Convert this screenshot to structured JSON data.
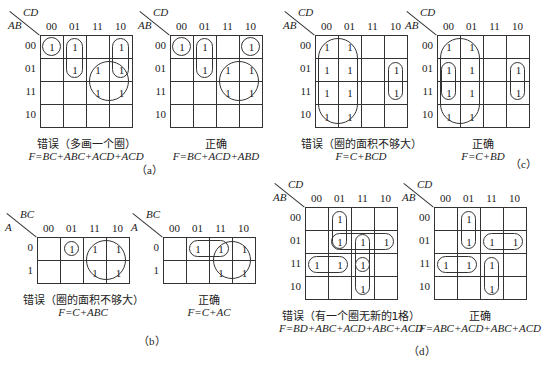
{
  "figures": {
    "a": {
      "label": "（a）",
      "wrong": {
        "row_var": "AB",
        "col_var": "CD",
        "col_labels": [
          "00",
          "01",
          "11",
          "10"
        ],
        "row_labels": [
          "00",
          "01",
          "11",
          "10"
        ],
        "cells": [
          [
            "1",
            "1",
            "",
            "1"
          ],
          [
            "",
            "1",
            "1",
            "1"
          ],
          [
            "",
            "",
            "1",
            "1"
          ],
          [
            "",
            "",
            "",
            ""
          ]
        ],
        "caption": "错误（多画一个圈）",
        "formula": "F=BC+ABC+ACD+ACD"
      },
      "right": {
        "row_var": "AB",
        "col_var": "CD",
        "col_labels": [
          "00",
          "01",
          "11",
          "10"
        ],
        "row_labels": [
          "00",
          "01",
          "11",
          "10"
        ],
        "cells": [
          [
            "1",
            "1",
            "",
            "1"
          ],
          [
            "",
            "1",
            "1",
            "1"
          ],
          [
            "",
            "",
            "1",
            "1"
          ],
          [
            "",
            "",
            "",
            ""
          ]
        ],
        "caption": "正确",
        "formula": "F=BC+ACD+ABD"
      }
    },
    "b": {
      "label": "（b）",
      "wrong": {
        "row_var": "A",
        "col_var": "BC",
        "col_labels": [
          "00",
          "01",
          "11",
          "10"
        ],
        "row_labels": [
          "0",
          "1"
        ],
        "cells": [
          [
            "",
            "1",
            "1",
            "1"
          ],
          [
            "",
            "",
            "1",
            "1"
          ]
        ],
        "caption": "错误（圈的面积不够大）",
        "formula": "F=C+ABC"
      },
      "right": {
        "row_var": "A",
        "col_var": "BC",
        "col_labels": [
          "00",
          "01",
          "11",
          "10"
        ],
        "row_labels": [
          "0",
          "1"
        ],
        "cells": [
          [
            "",
            "1",
            "1",
            "1"
          ],
          [
            "",
            "",
            "1",
            "1"
          ]
        ],
        "caption": "正确",
        "formula": "F=C+AC"
      }
    },
    "c": {
      "label": "（c）",
      "wrong": {
        "row_var": "AB",
        "col_var": "CD",
        "col_labels": [
          "00",
          "01",
          "11",
          "10"
        ],
        "row_labels": [
          "00",
          "01",
          "11",
          "10"
        ],
        "cells": [
          [
            "1",
            "1",
            "",
            ""
          ],
          [
            "1",
            "1",
            "",
            "1"
          ],
          [
            "1",
            "1",
            "",
            "1"
          ],
          [
            "1",
            "1",
            "",
            ""
          ]
        ],
        "caption": "错误（圈的面积不够大）",
        "formula": "F=C+BCD"
      },
      "right": {
        "row_var": "AB",
        "col_var": "CD",
        "col_labels": [
          "00",
          "01",
          "11",
          "10"
        ],
        "row_labels": [
          "00",
          "01",
          "11",
          "10"
        ],
        "cells": [
          [
            "1",
            "1",
            "",
            ""
          ],
          [
            "1",
            "1",
            "",
            "1"
          ],
          [
            "1",
            "1",
            "",
            "1"
          ],
          [
            "1",
            "1",
            "",
            ""
          ]
        ],
        "caption": "正确",
        "formula": "F=C+BD"
      }
    },
    "d": {
      "label": "（d）",
      "wrong": {
        "row_var": "AB",
        "col_var": "CD",
        "col_labels": [
          "00",
          "01",
          "11",
          "10"
        ],
        "row_labels": [
          "00",
          "01",
          "11",
          "10"
        ],
        "cells": [
          [
            "",
            "1",
            "",
            ""
          ],
          [
            "",
            "1",
            "1",
            "1"
          ],
          [
            "1",
            "1",
            "1",
            ""
          ],
          [
            "",
            "",
            "1",
            ""
          ]
        ],
        "caption": "错误（有一个圈无新的1格）",
        "formula": "F=BD+ABC+ACD+ABC+ACD"
      },
      "right": {
        "row_var": "AB",
        "col_var": "CD",
        "col_labels": [
          "00",
          "01",
          "11",
          "10"
        ],
        "row_labels": [
          "00",
          "01",
          "11",
          "10"
        ],
        "cells": [
          [
            "",
            "1",
            "",
            ""
          ],
          [
            "",
            "1",
            "1",
            "1"
          ],
          [
            "1",
            "1",
            "1",
            ""
          ],
          [
            "",
            "",
            "1",
            ""
          ]
        ],
        "caption": "正确",
        "formula": "F=ABC+ACD+ABC+ACD"
      }
    }
  }
}
